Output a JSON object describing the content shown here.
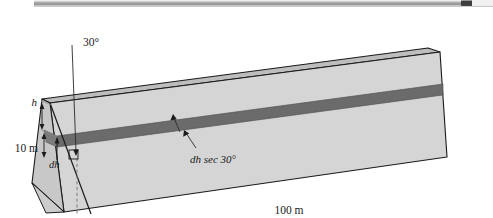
{
  "figure": {
    "colors": {
      "face_fill": "#d5d5d5",
      "end_face_fill": "#c8c8c8",
      "top_face_fill": "#bdbdbd",
      "strip_fill": "#6b6b6b",
      "outline": "#1a1a1a",
      "leader": "#2a2a2a",
      "dashed": "#7a7a7a",
      "scrollbar_track": "#f0f0f0",
      "scrollbar_thumb": "#9a9a9a",
      "scrollbar_end": "#3d3d3d"
    },
    "labels": {
      "angle": "30°",
      "height_h": "h",
      "depth_10m": "10 m",
      "differential_dh": "dh",
      "strip_width": "dh sec 30°",
      "length_100m": "100 m"
    }
  },
  "scrollbar": {
    "present": true,
    "orientation": "horizontal"
  }
}
